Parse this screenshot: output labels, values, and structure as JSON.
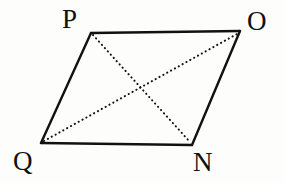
{
  "figure": {
    "kind": "geometry-diagram",
    "shape_name": "parallelogram",
    "background_color": "#fdfdfb",
    "stroke_color": "#111111",
    "edge_stroke_width": 2.4,
    "diagonal_stroke_width": 2.0,
    "diagonal_style": "dotted",
    "vertices": [
      {
        "id": "P",
        "label": "P",
        "x": 91,
        "y": 33,
        "label_x": 62,
        "label_y": 6
      },
      {
        "id": "O",
        "label": "O",
        "x": 240,
        "y": 31,
        "label_x": 247,
        "label_y": 8
      },
      {
        "id": "N",
        "label": "N",
        "x": 192,
        "y": 145,
        "label_x": 193,
        "label_y": 149
      },
      {
        "id": "Q",
        "label": "Q",
        "x": 41,
        "y": 143,
        "label_x": 13,
        "label_y": 148
      }
    ],
    "edges": [
      {
        "id": "PO",
        "from": "P",
        "to": "O",
        "style": "solid",
        "x1": 91,
        "y1": 33,
        "x2": 240,
        "y2": 31
      },
      {
        "id": "ON",
        "from": "O",
        "to": "N",
        "style": "solid",
        "x1": 240,
        "y1": 31,
        "x2": 192,
        "y2": 145
      },
      {
        "id": "NQ",
        "from": "N",
        "to": "Q",
        "style": "solid",
        "x1": 192,
        "y1": 145,
        "x2": 41,
        "y2": 143
      },
      {
        "id": "QP",
        "from": "Q",
        "to": "P",
        "style": "solid",
        "x1": 41,
        "y1": 143,
        "x2": 91,
        "y2": 33
      }
    ],
    "diagonals": [
      {
        "id": "PN",
        "from": "P",
        "to": "N",
        "style": "dotted",
        "x1": 93,
        "y1": 35,
        "x2": 190,
        "y2": 142
      },
      {
        "id": "QO",
        "from": "Q",
        "to": "O",
        "style": "dotted",
        "x1": 44,
        "y1": 141,
        "x2": 237,
        "y2": 34
      }
    ],
    "diagonal_intersection": {
      "x": 141,
      "y": 88
    }
  },
  "chart_data": {
    "type": "scatter",
    "title": "",
    "xlabel": "",
    "ylabel": "",
    "categories": [
      "P",
      "O",
      "N",
      "Q"
    ],
    "x": [
      91,
      240,
      192,
      41
    ],
    "y": [
      33,
      31,
      145,
      143
    ],
    "series": [
      {
        "name": "outline",
        "values": [
          91,
          240,
          192,
          41
        ]
      }
    ]
  }
}
